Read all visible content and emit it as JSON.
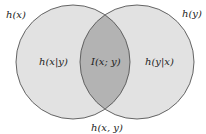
{
  "diagram": {
    "type": "venn",
    "labels": {
      "hx": "h(x)",
      "hy": "h(y)",
      "hx_given_y": "h(x|y)",
      "hy_given_x": "h(y|x)",
      "mutual_info": "I(x; y)",
      "joint": "h(x, y)"
    },
    "sets": [
      {
        "name": "h(x)",
        "region_label": "h(x|y)"
      },
      {
        "name": "h(y)",
        "region_label": "h(y|x)"
      }
    ],
    "intersection": "I(x; y)",
    "union": "h(x, y)",
    "colors": {
      "circle_fill": "#e2e2e2",
      "overlap_fill": "#b3b3b3",
      "stroke": "#555555"
    }
  }
}
